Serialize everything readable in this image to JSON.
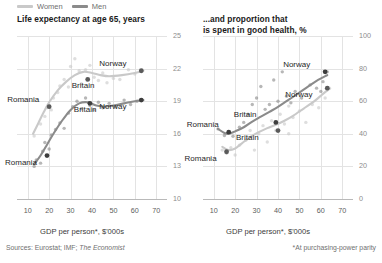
{
  "legend": {
    "items": [
      {
        "label": "Women",
        "color": "#c9c9c9"
      },
      {
        "label": "Men",
        "color": "#8b8b8b"
      }
    ]
  },
  "footer": {
    "sources_prefix": "Sources: Eurostat; IMF; ",
    "sources_italic": "The Economist",
    "note": "*At purchasing-power parity"
  },
  "chart_data": [
    {
      "type": "scatter",
      "panel": "left",
      "title": "Life expectancy at age 65, years",
      "xlabel": "GDP per person*, $'000s",
      "ylabel": "",
      "xlim": [
        5,
        75
      ],
      "ylim": [
        10,
        25
      ],
      "xticks": [
        10,
        20,
        30,
        40,
        50,
        60,
        70
      ],
      "yticks": [
        10,
        13,
        16,
        19,
        22,
        25
      ],
      "grid": true,
      "legend_position": "top-left-external",
      "series": [
        {
          "name": "Women",
          "color": "#c9c9c9",
          "trend": [
            [
              12.5,
              16.0
            ],
            [
              15.0,
              17.0
            ],
            [
              17.5,
              18.0
            ],
            [
              20.0,
              18.9
            ],
            [
              24.0,
              20.0
            ],
            [
              28.0,
              20.8
            ],
            [
              32.0,
              21.4
            ],
            [
              36.0,
              21.7
            ],
            [
              40.0,
              21.6
            ],
            [
              44.0,
              21.4
            ],
            [
              48.0,
              21.3
            ],
            [
              54.0,
              21.4
            ],
            [
              60.0,
              21.6
            ],
            [
              64.0,
              21.8
            ]
          ],
          "points": [
            [
              13.0,
              15.8
            ],
            [
              16.0,
              16.9
            ],
            [
              18.0,
              17.6
            ],
            [
              19.0,
              18.4
            ],
            [
              21.0,
              18.2
            ],
            [
              22.0,
              19.3
            ],
            [
              24.0,
              19.8
            ],
            [
              25.0,
              20.4
            ],
            [
              27.0,
              21.0
            ],
            [
              29.0,
              20.3
            ],
            [
              30.0,
              22.2
            ],
            [
              32.0,
              22.9
            ],
            [
              34.0,
              21.8
            ],
            [
              35.0,
              20.6
            ],
            [
              37.0,
              21.9
            ],
            [
              39.0,
              22.3
            ],
            [
              41.0,
              21.2
            ],
            [
              43.0,
              20.9
            ],
            [
              45.0,
              21.6
            ],
            [
              47.0,
              20.7
            ],
            [
              50.0,
              21.1
            ],
            [
              53.0,
              21.0
            ],
            [
              57.0,
              21.9
            ],
            [
              60.0,
              21.5
            ]
          ],
          "highlights": [
            {
              "label": "Romania",
              "x": 20.0,
              "y": 18.5,
              "anchor": "above-left"
            },
            {
              "label": "Britain",
              "x": 38.0,
              "y": 21.0,
              "anchor": "below"
            },
            {
              "label": "Norway",
              "x": 63.0,
              "y": 21.8,
              "anchor": "above-left"
            }
          ]
        },
        {
          "name": "Men",
          "color": "#8b8b8b",
          "trend": [
            [
              13.0,
              13.2
            ],
            [
              16.0,
              14.0
            ],
            [
              19.0,
              15.0
            ],
            [
              22.0,
              16.0
            ],
            [
              26.0,
              17.2
            ],
            [
              30.0,
              18.2
            ],
            [
              34.0,
              18.8
            ],
            [
              38.0,
              18.9
            ],
            [
              42.0,
              18.6
            ],
            [
              46.0,
              18.5
            ],
            [
              50.0,
              18.6
            ],
            [
              55.0,
              18.8
            ],
            [
              60.0,
              19.0
            ],
            [
              64.0,
              19.1
            ]
          ],
          "points": [
            [
              13.0,
              13.0
            ],
            [
              14.0,
              13.6
            ],
            [
              16.0,
              13.3
            ],
            [
              17.0,
              14.4
            ],
            [
              18.0,
              15.2
            ],
            [
              20.0,
              14.6
            ],
            [
              21.0,
              15.9
            ],
            [
              23.0,
              16.4
            ],
            [
              25.0,
              17.0
            ],
            [
              27.0,
              16.5
            ],
            [
              29.0,
              17.9
            ],
            [
              31.0,
              18.5
            ],
            [
              33.0,
              19.0
            ],
            [
              35.0,
              18.3
            ],
            [
              37.0,
              19.3
            ],
            [
              39.0,
              18.6
            ],
            [
              41.0,
              18.2
            ],
            [
              43.0,
              18.9
            ],
            [
              45.0,
              18.4
            ],
            [
              48.0,
              18.8
            ],
            [
              51.0,
              18.5
            ],
            [
              55.0,
              19.1
            ],
            [
              58.0,
              18.7
            ],
            [
              61.0,
              19.0
            ]
          ],
          "highlights": [
            {
              "label": "Romania",
              "x": 19.0,
              "y": 14.0,
              "anchor": "below-left"
            },
            {
              "label": "Britain",
              "x": 39.0,
              "y": 18.8,
              "anchor": "below"
            },
            {
              "label": "Norway",
              "x": 63.0,
              "y": 19.1,
              "anchor": "below-left"
            }
          ]
        }
      ]
    },
    {
      "type": "scatter",
      "panel": "right",
      "title": "...and proportion that\nis spent in good health, %",
      "xlabel": "GDP per person*, $'000s",
      "ylabel": "",
      "xlim": [
        5,
        75
      ],
      "ylim": [
        0,
        100
      ],
      "xticks": [
        10,
        20,
        30,
        40,
        50,
        60,
        70
      ],
      "yticks": [
        0,
        20,
        40,
        60,
        80,
        100
      ],
      "grid": true,
      "legend_position": "shared",
      "series": [
        {
          "name": "Men",
          "color": "#8b8b8b",
          "trend": [
            [
              12.0,
              43.0
            ],
            [
              15.0,
              40.5
            ],
            [
              17.0,
              40.0
            ],
            [
              20.0,
              41.5
            ],
            [
              24.0,
              44.0
            ],
            [
              28.0,
              47.5
            ],
            [
              32.0,
              50.5
            ],
            [
              36.0,
              53.5
            ],
            [
              40.0,
              56.5
            ],
            [
              44.0,
              60.0
            ],
            [
              48.0,
              63.5
            ],
            [
              53.0,
              68.0
            ],
            [
              58.0,
              72.5
            ],
            [
              63.0,
              76.0
            ]
          ],
          "points": [
            [
              12.0,
              43.0
            ],
            [
              15.0,
              39.0
            ],
            [
              17.0,
              41.0
            ],
            [
              19.0,
              38.5
            ],
            [
              22.0,
              44.0
            ],
            [
              24.0,
              47.0
            ],
            [
              26.0,
              52.0
            ],
            [
              28.0,
              58.0
            ],
            [
              30.0,
              62.0
            ],
            [
              32.0,
              69.0
            ],
            [
              34.0,
              55.0
            ],
            [
              36.0,
              58.0
            ],
            [
              38.0,
              73.0
            ],
            [
              40.0,
              60.0
            ],
            [
              42.0,
              78.0
            ],
            [
              44.0,
              63.0
            ],
            [
              46.0,
              59.0
            ],
            [
              48.0,
              66.0
            ],
            [
              51.0,
              62.0
            ],
            [
              55.0,
              70.0
            ],
            [
              58.0,
              68.0
            ],
            [
              61.0,
              72.0
            ],
            [
              63.0,
              78.0
            ],
            [
              60.0,
              66.0
            ]
          ],
          "highlights": [
            {
              "label": "Romania",
              "x": 17.0,
              "y": 41.0,
              "anchor": "above-left"
            },
            {
              "label": "Britain",
              "x": 39.0,
              "y": 47.0,
              "anchor": "above-left"
            },
            {
              "label": "Norway",
              "x": 62.0,
              "y": 78.0,
              "anchor": "above-left"
            }
          ]
        },
        {
          "name": "Women",
          "color": "#c9c9c9",
          "trend": [
            [
              14.0,
              32.0
            ],
            [
              17.0,
              30.0
            ],
            [
              20.0,
              31.0
            ],
            [
              23.0,
              34.0
            ],
            [
              27.0,
              38.0
            ],
            [
              31.0,
              41.0
            ],
            [
              35.0,
              43.5
            ],
            [
              39.0,
              45.5
            ],
            [
              43.0,
              48.0
            ],
            [
              47.0,
              51.0
            ],
            [
              52.0,
              55.5
            ],
            [
              57.0,
              60.0
            ],
            [
              61.0,
              64.5
            ],
            [
              64.0,
              67.5
            ]
          ],
          "points": [
            [
              14.0,
              30.0
            ],
            [
              16.0,
              28.0
            ],
            [
              18.0,
              31.5
            ],
            [
              20.0,
              27.0
            ],
            [
              22.0,
              33.0
            ],
            [
              25.0,
              36.0
            ],
            [
              27.0,
              42.0
            ],
            [
              29.0,
              30.0
            ],
            [
              31.0,
              40.0
            ],
            [
              33.0,
              45.0
            ],
            [
              35.0,
              35.0
            ],
            [
              37.0,
              48.0
            ],
            [
              39.0,
              42.0
            ],
            [
              41.0,
              52.0
            ],
            [
              43.0,
              46.0
            ],
            [
              45.0,
              57.0
            ],
            [
              47.0,
              50.0
            ],
            [
              50.0,
              54.0
            ],
            [
              53.0,
              47.0
            ],
            [
              56.0,
              58.0
            ],
            [
              59.0,
              56.0
            ],
            [
              62.0,
              62.0
            ],
            [
              64.0,
              68.0
            ],
            [
              45.0,
              40.0
            ]
          ],
          "highlights": [
            {
              "label": "Romania",
              "x": 16.0,
              "y": 29.0,
              "anchor": "below-left"
            },
            {
              "label": "Britain",
              "x": 40.0,
              "y": 42.0,
              "anchor": "below-left"
            },
            {
              "label": "Norway",
              "x": 63.0,
              "y": 68.0,
              "anchor": "below-left"
            }
          ]
        }
      ]
    }
  ]
}
